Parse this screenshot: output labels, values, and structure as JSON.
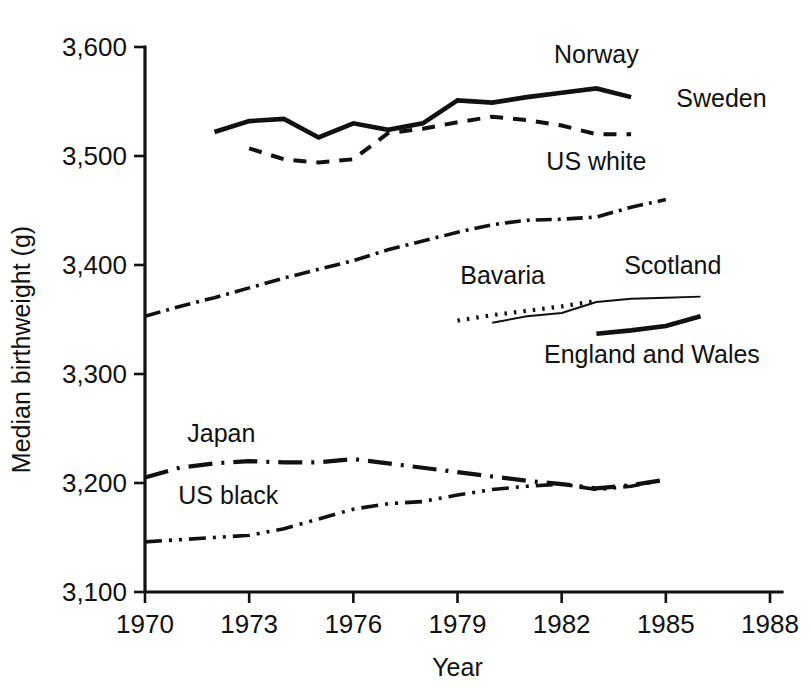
{
  "chart_data": {
    "type": "line",
    "title": "",
    "xlabel": "Year",
    "ylabel": "Median birthweight (g)",
    "xlim": [
      1970,
      1988
    ],
    "ylim": [
      3100,
      3600
    ],
    "xticks": [
      "1970",
      "1973",
      "1976",
      "1979",
      "1982",
      "1985",
      "1988"
    ],
    "xtick_values": [
      1970,
      1973,
      1976,
      1979,
      1982,
      1985,
      1988
    ],
    "yticks": [
      "3,100",
      "3,200",
      "3,300",
      "3,400",
      "3,500",
      "3,600"
    ],
    "ytick_values": [
      3100,
      3200,
      3300,
      3400,
      3500,
      3600
    ],
    "grid": false,
    "legend_position": "inline-labels",
    "series": [
      {
        "name": "Norway",
        "label": "Norway",
        "line_style": "solid-thick",
        "x": [
          1972,
          1973,
          1974,
          1975,
          1976,
          1977,
          1978,
          1979,
          1980,
          1981,
          1982,
          1983,
          1984
        ],
        "values": [
          3522,
          3532,
          3534,
          3517,
          3530,
          3524,
          3530,
          3551,
          3549,
          3554,
          3558,
          3562,
          3554
        ]
      },
      {
        "name": "Sweden",
        "label": "Sweden",
        "line_style": "dashed",
        "x": [
          1973,
          1974,
          1975,
          1976,
          1977,
          1978,
          1979,
          1980,
          1981,
          1982,
          1983,
          1984
        ],
        "values": [
          3507,
          3497,
          3494,
          3497,
          3521,
          3525,
          3531,
          3536,
          3533,
          3528,
          3520,
          3520
        ]
      },
      {
        "name": "US white",
        "label": "US white",
        "line_style": "dash-dot",
        "x": [
          1970,
          1971,
          1972,
          1973,
          1974,
          1975,
          1976,
          1977,
          1978,
          1979,
          1980,
          1981,
          1982,
          1983,
          1984,
          1985
        ],
        "values": [
          3353,
          3362,
          3370,
          3379,
          3388,
          3396,
          3404,
          3414,
          3422,
          3430,
          3437,
          3441,
          3442,
          3444,
          3453,
          3460
        ]
      },
      {
        "name": "Bavaria",
        "label": "Bavaria",
        "line_style": "dotted",
        "x": [
          1979,
          1980,
          1981,
          1982,
          1983
        ],
        "values": [
          3349,
          3354,
          3358,
          3362,
          3367
        ]
      },
      {
        "name": "Scotland",
        "label": "Scotland",
        "line_style": "solid-thin",
        "x": [
          1980,
          1981,
          1982,
          1983,
          1984,
          1985,
          1986
        ],
        "values": [
          3347,
          3353,
          3356,
          3366,
          3369,
          3370,
          3371
        ]
      },
      {
        "name": "England and Wales",
        "label": "England and Wales",
        "line_style": "solid-thick",
        "x": [
          1983,
          1984,
          1985,
          1986
        ],
        "values": [
          3337,
          3340,
          3344,
          3353
        ]
      },
      {
        "name": "Japan",
        "label": "Japan",
        "line_style": "long-dash-dot",
        "x": [
          1970,
          1971,
          1972,
          1973,
          1974,
          1975,
          1976,
          1977,
          1978,
          1979,
          1980,
          1981,
          1982,
          1983,
          1984,
          1985
        ],
        "values": [
          3205,
          3214,
          3218,
          3220,
          3219,
          3219,
          3222,
          3218,
          3214,
          3210,
          3206,
          3202,
          3199,
          3195,
          3198,
          3203
        ]
      },
      {
        "name": "US black",
        "label": "US black",
        "line_style": "dash-dot-dot",
        "x": [
          1970,
          1971,
          1972,
          1973,
          1974,
          1975,
          1976,
          1977,
          1978,
          1979,
          1980,
          1981,
          1982,
          1983,
          1984,
          1985
        ],
        "values": [
          3146,
          3148,
          3150,
          3152,
          3158,
          3167,
          3176,
          3181,
          3183,
          3189,
          3194,
          3197,
          3199,
          3194,
          3197,
          3203
        ]
      }
    ],
    "annotations": [
      {
        "text": "Norway",
        "x": 1983.0,
        "y": 3585,
        "anchor": "middle"
      },
      {
        "text": "Sweden",
        "x": 1985.3,
        "y": 3545,
        "anchor": "start"
      },
      {
        "text": "US white",
        "x": 1983.0,
        "y": 3487,
        "anchor": "middle"
      },
      {
        "text": "Bavaria",
        "x": 1980.3,
        "y": 3383,
        "anchor": "middle"
      },
      {
        "text": "Scotland",
        "x": 1985.2,
        "y": 3392,
        "anchor": "middle"
      },
      {
        "text": "England and Wales",
        "x": 1984.6,
        "y": 3310,
        "anchor": "middle"
      },
      {
        "text": "Japan",
        "x": 1972.2,
        "y": 3238,
        "anchor": "middle"
      },
      {
        "text": "US black",
        "x": 1972.4,
        "y": 3181,
        "anchor": "middle"
      }
    ],
    "colors": {
      "line": "#111111",
      "background": "#ffffff",
      "text": "#111111"
    }
  },
  "axes": {
    "y_title": "Median birthweight (g)",
    "x_title": "Year"
  }
}
